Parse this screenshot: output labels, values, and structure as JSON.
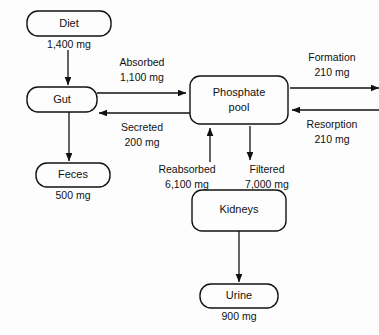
{
  "diagram": {
    "background_color": "#fdfdfd",
    "stroke_color": "#111111",
    "nodes": [
      {
        "id": "diet",
        "label": "Diet",
        "amount": "1,400 mg"
      },
      {
        "id": "gut",
        "label": "Gut",
        "amount": ""
      },
      {
        "id": "feces",
        "label": "Feces",
        "amount": "500 mg"
      },
      {
        "id": "pool",
        "label_line1": "Phosphate",
        "label_line2": "pool",
        "amount": ""
      },
      {
        "id": "kidneys",
        "label": "Kidneys",
        "amount": ""
      },
      {
        "id": "urine",
        "label": "Urine",
        "amount": "900 mg"
      }
    ],
    "flows": [
      {
        "id": "intake",
        "label": "",
        "amount": "1,400 mg",
        "from": "diet",
        "to": "gut",
        "direction": "down"
      },
      {
        "id": "absorbed",
        "label": "Absorbed",
        "amount": "1,100 mg",
        "from": "gut",
        "to": "pool",
        "direction": "right"
      },
      {
        "id": "secreted",
        "label": "Secreted",
        "amount": "200 mg",
        "from": "pool",
        "to": "gut",
        "direction": "left"
      },
      {
        "id": "excreted",
        "label": "",
        "amount": "500 mg",
        "from": "gut",
        "to": "feces",
        "direction": "down"
      },
      {
        "id": "formation",
        "label": "Formation",
        "amount": "210 mg",
        "from": "pool",
        "to": "bone",
        "direction": "right"
      },
      {
        "id": "resorption",
        "label": "Resorption",
        "amount": "210 mg",
        "from": "bone",
        "to": "pool",
        "direction": "left"
      },
      {
        "id": "reabsorbed",
        "label": "Reabsorbed",
        "amount": "6,100 mg",
        "from": "kidneys",
        "to": "pool",
        "direction": "up"
      },
      {
        "id": "filtered",
        "label": "Filtered",
        "amount": "7,000 mg",
        "from": "pool",
        "to": "kidneys",
        "direction": "down"
      },
      {
        "id": "urinary",
        "label": "",
        "amount": "900 mg",
        "from": "kidneys",
        "to": "urine",
        "direction": "down"
      }
    ],
    "text": {
      "diet": "Diet",
      "diet_amount": "1,400 mg",
      "gut": "Gut",
      "feces": "Feces",
      "feces_amount": "500 mg",
      "pool_line1": "Phosphate",
      "pool_line2": "pool",
      "kidneys": "Kidneys",
      "urine": "Urine",
      "urine_amount": "900 mg",
      "absorbed": "Absorbed",
      "absorbed_amount": "1,100 mg",
      "secreted": "Secreted",
      "secreted_amount": "200 mg",
      "formation": "Formation",
      "formation_amount": "210 mg",
      "resorption": "Resorption",
      "resorption_amount": "210 mg",
      "reabsorbed": "Reabsorbed",
      "reabsorbed_amount": "6,100 mg",
      "filtered": "Filtered",
      "filtered_amount": "7,000 mg"
    }
  }
}
